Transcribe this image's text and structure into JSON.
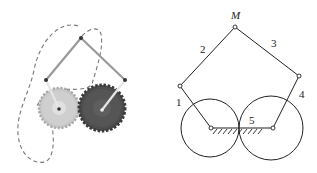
{
  "figure": {
    "left_panel": {
      "description": "gear-driven five-bar linkage with dashed coupler curves",
      "gear_left_color": "#b8b8b8",
      "gear_right_color": "#4a4a4a"
    },
    "right_panel": {
      "labels": {
        "point_m": "M",
        "link_1": "1",
        "link_2": "2",
        "link_3": "3",
        "link_4": "4",
        "link_5": "5"
      }
    }
  }
}
